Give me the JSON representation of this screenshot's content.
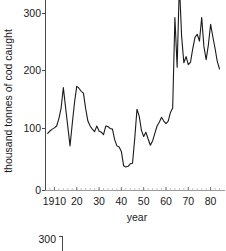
{
  "chart_data": {
    "type": "line",
    "title": "",
    "xlabel": "year",
    "ylabel": "thousand tonnes of cod caught",
    "xlim": [
      1906,
      1986
    ],
    "ylim": [
      0,
      345
    ],
    "grid": false,
    "legend": null,
    "y_ticks": [
      0,
      100,
      200,
      300
    ],
    "y_tick_labels": [
      "0",
      "100",
      "200",
      "300"
    ],
    "x_ticks": [
      1910,
      1920,
      1930,
      1940,
      1950,
      1960,
      1970,
      1980
    ],
    "x_tick_labels": [
      "1910",
      "20",
      "30",
      "40",
      "50",
      "60",
      "70",
      "80"
    ],
    "x_minor_tick_step": 2,
    "line_color": "#1a1a1a",
    "series": [
      {
        "name": "cod catch",
        "x": [
          1907,
          1908,
          1909,
          1910,
          1911,
          1912,
          1913,
          1914,
          1915,
          1916,
          1917,
          1918,
          1919,
          1920,
          1921,
          1922,
          1923,
          1924,
          1925,
          1926,
          1927,
          1928,
          1929,
          1930,
          1931,
          1932,
          1933,
          1934,
          1935,
          1936,
          1937,
          1938,
          1939,
          1940,
          1941,
          1942,
          1943,
          1944,
          1945,
          1946,
          1947,
          1948,
          1949,
          1950,
          1951,
          1952,
          1953,
          1954,
          1955,
          1956,
          1957,
          1958,
          1959,
          1960,
          1961,
          1962,
          1963,
          1964,
          1965,
          1966,
          1967,
          1968,
          1969,
          1970,
          1971,
          1972,
          1973,
          1974,
          1975,
          1976,
          1977,
          1978,
          1979,
          1980,
          1981,
          1982,
          1983,
          1984
        ],
        "values": [
          92,
          96,
          99,
          101,
          104,
          116,
          133,
          166,
          134,
          103,
          72,
          108,
          142,
          168,
          165,
          160,
          157,
          132,
          112,
          104,
          99,
          95,
          104,
          96,
          94,
          90,
          104,
          103,
          100,
          99,
          82,
          72,
          70,
          63,
          40,
          38,
          39,
          43,
          44,
          84,
          131,
          120,
          97,
          87,
          94,
          83,
          73,
          80,
          92,
          104,
          110,
          118,
          112,
          108,
          112,
          126,
          133,
          279,
          199,
          334,
          249,
          206,
          216,
          203,
          207,
          229,
          247,
          252,
          241,
          279,
          232,
          211,
          235,
          268,
          248,
          229,
          208,
          196
        ]
      }
    ]
  },
  "secondary_panel": {
    "y_tick_label": "300"
  }
}
